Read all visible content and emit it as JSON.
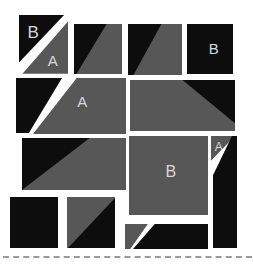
{
  "diagram": {
    "type": "quilt-block-assembly",
    "pieces": [
      {
        "id": "top-left-triangle-dark",
        "fabric": "dark",
        "label": "B"
      },
      {
        "id": "top-left-triangle-gray",
        "fabric": "gray",
        "label": "A"
      },
      {
        "id": "top-hst-2",
        "fabric": "dark-gray",
        "label": ""
      },
      {
        "id": "top-hst-3",
        "fabric": "dark-gray",
        "label": ""
      },
      {
        "id": "top-right-square-dark",
        "fabric": "dark",
        "label": "B"
      },
      {
        "id": "row2-left-triangle-dark",
        "fabric": "dark",
        "label": ""
      },
      {
        "id": "row2-trapezoid-gray",
        "fabric": "gray",
        "label": "A"
      },
      {
        "id": "row2-right-rect",
        "fabric": "gray-dark",
        "label": ""
      },
      {
        "id": "row3-left-rect",
        "fabric": "dark-gray",
        "label": ""
      },
      {
        "id": "center-square-gray",
        "fabric": "gray",
        "label": "B"
      },
      {
        "id": "right-triangle-gray",
        "fabric": "gray",
        "label": "A"
      },
      {
        "id": "right-pentagon-dark",
        "fabric": "dark",
        "label": ""
      },
      {
        "id": "bottom-left-square-dark",
        "fabric": "dark",
        "label": ""
      },
      {
        "id": "bottom-hst",
        "fabric": "gray-dark",
        "label": ""
      },
      {
        "id": "bottom-triangle-gray",
        "fabric": "gray",
        "label": ""
      },
      {
        "id": "bottom-trapezoid-dark",
        "fabric": "dark",
        "label": ""
      }
    ]
  },
  "colors": {
    "bg": "#ffffff",
    "dark_fabric": "#0d0d0d",
    "gray_fabric": "#575757",
    "label": "#d8d8d8",
    "cut_line": "#9a9a9a"
  }
}
